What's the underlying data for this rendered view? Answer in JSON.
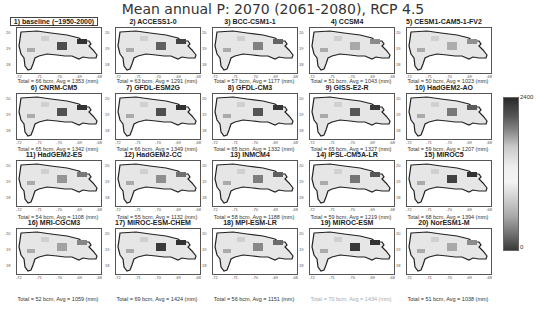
{
  "figure": {
    "title": "Mean annual P: 2070 (2061-2080),  RCP 4.5"
  },
  "colorbar": {
    "max_label": "2400",
    "min_label": "0",
    "colormap": "grayscale diverging (dark-light-dark)"
  },
  "axes": {
    "yticks": [
      "20",
      "19",
      "18"
    ],
    "xticks": [
      "-72",
      "-71",
      "-70",
      "-69",
      "-68"
    ]
  },
  "panels": [
    {
      "title": "1) baseline (~1950-2000)",
      "caption": "Total = 66 bcm, Avg = 1353 (mm)"
    },
    {
      "title": "2) ACCESS1-0",
      "caption": "Total = 63 bcm, Avg = 1291 (mm)"
    },
    {
      "title": "3) BCC-CSM1-1",
      "caption": "Total = 57 bcm, Avg = 1177 (mm)"
    },
    {
      "title": "4) CCSM4",
      "caption": "Total = 51 bcm, Avg = 1043 (mm)"
    },
    {
      "title": "5) CESM1-CAM5-1-FV2",
      "caption": "Total = 50 bcm, Avg = 1023 (mm)"
    },
    {
      "title": "6) CNRM-CM5",
      "caption": "Total = 65 bcm, Avg = 1342 (mm)"
    },
    {
      "title": "7) GFDL-ESM2G",
      "caption": "Total = 66 bcm, Avg = 1349 (mm)"
    },
    {
      "title": "8) GFDL-CM3",
      "caption": "Total = 65 bcm, Avg = 1332 (mm)"
    },
    {
      "title": "9) GISS-E2-R",
      "caption": "Total = 65 bcm, Avg = 1327 (mm)"
    },
    {
      "title": "10) HadGEM2-AO",
      "caption": "Total = 59 bcm, Avg = 1207 (mm)"
    },
    {
      "title": "11) HadGEM2-ES",
      "caption": "Total = 54 bcm, Avg = 1108 (mm)"
    },
    {
      "title": "12) HadGEM2-CC",
      "caption": "Total = 55 bcm, Avg = 1132 (mm)"
    },
    {
      "title": "13) INMCM4",
      "caption": "Total = 58 bcm, Avg = 1188 (mm)"
    },
    {
      "title": "14) IPSL-CM5A-LR",
      "caption": "Total = 59 bcm, Avg = 1219 (mm)"
    },
    {
      "title": "15) MIROC5",
      "caption": "Total = 68 bcm, Avg = 1394 (mm)"
    },
    {
      "title": "16) MRI-CGCM3",
      "caption": "Total = 52 bcm, Avg = 1059 (mm)"
    },
    {
      "title": "17) MIROC-ESM-CHEM",
      "caption": "Total = 69 bcm, Avg = 1424 (mm)"
    },
    {
      "title": "18) MPI-ESM-LR",
      "caption": "Total = 56 bcm, Avg = 1151 (mm)"
    },
    {
      "title": "19) MIROC-ESM",
      "caption": "Total = 70 bcm, Avg = 1434 (mm)"
    },
    {
      "title": "20) NorESM1-M",
      "caption": "Total = 51 bcm, Avg = 1038 (mm)"
    }
  ],
  "chart_data": {
    "type": "heatmap",
    "title": "Mean annual P: 2070 (2061-2080),  RCP 4.5",
    "xlabel": "Longitude",
    "ylabel": "Latitude",
    "xlim": [
      -72,
      -68
    ],
    "ylim": [
      17.5,
      20.2
    ],
    "x_ticks": [
      -72,
      -71,
      -70,
      -69,
      -68
    ],
    "y_ticks": [
      18,
      19,
      20
    ],
    "colorbar_range": [
      0,
      2400
    ],
    "colorbar_units": "mm",
    "grid": false,
    "legend_position": "right colorbar",
    "categories": [
      "baseline (~1950-2000)",
      "ACCESS1-0",
      "BCC-CSM1-1",
      "CCSM4",
      "CESM1-CAM5-1-FV2",
      "CNRM-CM5",
      "GFDL-ESM2G",
      "GFDL-CM3",
      "GISS-E2-R",
      "HadGEM2-AO",
      "HadGEM2-ES",
      "HadGEM2-CC",
      "INMCM4",
      "IPSL-CM5A-LR",
      "MIROC5",
      "MRI-CGCM3",
      "MIROC-ESM-CHEM",
      "MPI-ESM-LR",
      "MIROC-ESM",
      "NorESM1-M"
    ],
    "series": [
      {
        "name": "Total (bcm)",
        "values": [
          66,
          63,
          57,
          51,
          50,
          65,
          66,
          65,
          65,
          59,
          54,
          55,
          58,
          59,
          68,
          52,
          69,
          56,
          70,
          51
        ]
      },
      {
        "name": "Avg (mm)",
        "values": [
          1353,
          1291,
          1177,
          1043,
          1023,
          1342,
          1349,
          1332,
          1327,
          1207,
          1108,
          1132,
          1188,
          1219,
          1394,
          1059,
          1424,
          1151,
          1434,
          1038
        ]
      }
    ]
  }
}
